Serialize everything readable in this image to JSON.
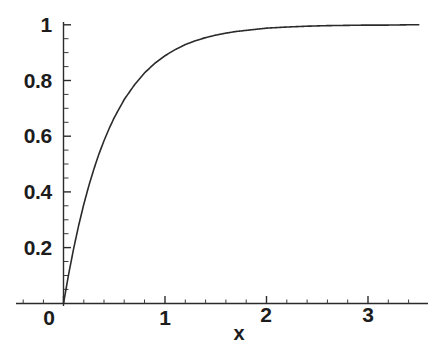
{
  "chart_data": {
    "type": "line",
    "title": "",
    "subtitle": "",
    "xlabel": "x",
    "ylabel": "",
    "xlim": [
      -0.22,
      3.65
    ],
    "ylim": [
      -0.04,
      1.04
    ],
    "grid": false,
    "legend": null,
    "legend_position": "none",
    "line_color": "#2b2b2b",
    "background_color": "#ffffff",
    "axis_color": "#2b2b2b",
    "xticks": [
      0,
      1,
      2,
      3
    ],
    "xtick_labels": [
      "0",
      "1",
      "2",
      "3"
    ],
    "yticks": [
      0.2,
      0.4,
      0.6,
      0.8,
      1
    ],
    "ytick_labels": [
      "0.2",
      "0.4",
      "0.6",
      "0.8",
      "1"
    ],
    "x_minor_tick_step": 0.2,
    "y_minor_tick_step": 0.05,
    "function": "1 - exp(-2.2*x)",
    "series": [
      {
        "name": "curve",
        "x": [
          0,
          0.05,
          0.1,
          0.15,
          0.2,
          0.25,
          0.3,
          0.35,
          0.4,
          0.45,
          0.5,
          0.6,
          0.7,
          0.8,
          0.9,
          1.0,
          1.1,
          1.2,
          1.3,
          1.4,
          1.5,
          1.6,
          1.7,
          1.8,
          1.9,
          2.0,
          2.2,
          2.4,
          2.6,
          2.8,
          3.0,
          3.2,
          3.4,
          3.5
        ],
        "y": [
          0.0,
          0.104,
          0.197,
          0.281,
          0.356,
          0.423,
          0.483,
          0.537,
          0.585,
          0.628,
          0.667,
          0.733,
          0.785,
          0.828,
          0.862,
          0.889,
          0.911,
          0.929,
          0.943,
          0.954,
          0.963,
          0.97,
          0.976,
          0.98,
          0.984,
          0.988,
          0.992,
          0.995,
          0.997,
          0.998,
          0.999,
          0.999,
          1.0,
          1.0
        ]
      }
    ]
  },
  "axes": {
    "x_axis_label": "x",
    "y_tick_0": "0.2",
    "y_tick_1": "0.4",
    "y_tick_2": "0.6",
    "y_tick_3": "0.8",
    "y_tick_4": "1",
    "x_tick_0": "0",
    "x_tick_1": "1",
    "x_tick_2": "2",
    "x_tick_3": "3"
  }
}
